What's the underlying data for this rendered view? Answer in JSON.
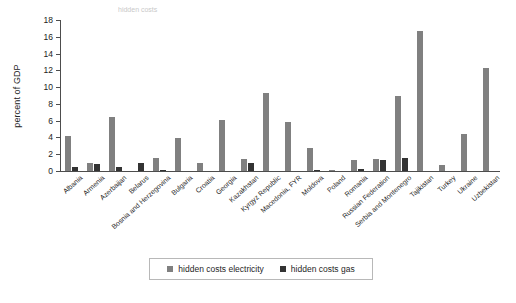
{
  "figure": {
    "title_fragment_left": "hidden costs",
    "title_fragment_right": "",
    "ylabel": "percent of GDP"
  },
  "legend": {
    "items": [
      {
        "label": "hidden costs electricity",
        "color": "#808080",
        "key": "electricity"
      },
      {
        "label": "hidden costs gas",
        "color": "#333333",
        "key": "gas"
      }
    ]
  },
  "axis": {
    "y_ticks": [
      "0",
      "2",
      "4",
      "6",
      "8",
      "10",
      "12",
      "14",
      "16",
      "18"
    ]
  },
  "chart_data": {
    "type": "bar",
    "title": "",
    "xlabel": "",
    "ylabel": "percent of GDP",
    "ylim": [
      0,
      18
    ],
    "ytick_step": 2,
    "grid": false,
    "legend_position": "bottom",
    "categories": [
      "Albania",
      "Armenia",
      "Azerbaijan",
      "Belarus",
      "Bosnia and Herzegovina",
      "Bulgaria",
      "Croatia",
      "Georgia",
      "Kazakhstan",
      "Kyrgyz Republic",
      "Macedonia, FYR",
      "Moldova",
      "Poland",
      "Romania",
      "Russian Federation",
      "Serbia and Montenegro",
      "Tajikistan",
      "Turkey",
      "Ukraine",
      "Uzbekistan"
    ],
    "series": [
      {
        "name": "hidden costs electricity",
        "color": "#808080",
        "values": [
          4.2,
          1.0,
          6.4,
          0.0,
          1.5,
          3.9,
          1.0,
          6.1,
          1.4,
          9.3,
          5.9,
          2.7,
          0.1,
          1.3,
          1.4,
          9.0,
          16.7,
          0.7,
          4.4,
          12.3
        ]
      },
      {
        "name": "hidden costs gas",
        "color": "#333333",
        "values": [
          0.5,
          0.8,
          0.5,
          1.0,
          0.1,
          0.0,
          0.0,
          0.0,
          0.9,
          0.0,
          0.0,
          0.1,
          0.0,
          0.2,
          1.3,
          1.6,
          0.0,
          0.0,
          0.0,
          0.0
        ]
      }
    ]
  }
}
